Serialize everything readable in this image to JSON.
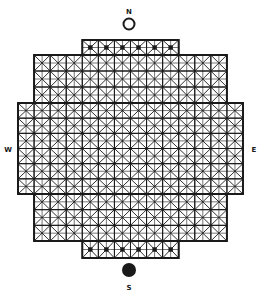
{
  "diagram": {
    "type": "grid-layout",
    "compass": {
      "north": {
        "label": "N",
        "marker": "open-circle"
      },
      "south": {
        "label": "S",
        "marker": "filled-circle"
      },
      "west": {
        "label": "W"
      },
      "east": {
        "label": "E"
      }
    },
    "grid": {
      "cell_size": 16,
      "origin_x": 18,
      "cell_style": "square-with-x-diagonals-and-center-cross",
      "rows": [
        {
          "name": "top-row",
          "start_col": 4,
          "cols": 6,
          "y": 40,
          "h": 15,
          "center_dots": true
        },
        {
          "name": "upper-block",
          "start_col": 1,
          "cols": 12,
          "y": 55,
          "h": 48,
          "rows": 3,
          "center_dots": false
        },
        {
          "name": "wide-block",
          "start_col": 0,
          "cols": 14,
          "y": 103,
          "h": 91,
          "rows": 6,
          "center_dots": false
        },
        {
          "name": "lower-block",
          "start_col": 1,
          "cols": 12,
          "y": 194,
          "h": 47,
          "rows": 3,
          "center_dots": false
        },
        {
          "name": "bottom-row",
          "start_col": 4,
          "cols": 6,
          "y": 241,
          "h": 17,
          "center_dots": true
        }
      ]
    },
    "colors": {
      "line": "#1a1a1a",
      "background": "#ffffff"
    }
  }
}
